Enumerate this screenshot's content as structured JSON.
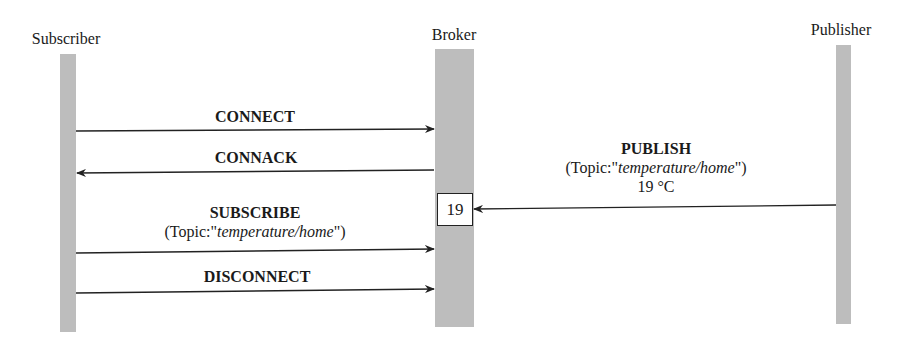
{
  "actors": [
    {
      "id": "subscriber",
      "label": "Subscriber"
    },
    {
      "id": "broker",
      "label": "Broker"
    },
    {
      "id": "publisher",
      "label": "Publisher"
    }
  ],
  "messages": [
    {
      "label": "CONNECT",
      "from": "Subscriber",
      "to": "Broker"
    },
    {
      "label": "CONNACK",
      "from": "Broker",
      "to": "Subscriber"
    },
    {
      "label": "PUBLISH",
      "topic_prefix": "(Topic:\"",
      "topic": "temperature/home",
      "topic_suffix": "\")",
      "payload": "19 °C",
      "from": "Publisher",
      "to": "Broker"
    },
    {
      "label": "SUBSCRIBE",
      "topic_prefix": "(Topic:\"",
      "topic": "temperature/home",
      "topic_suffix": "\")",
      "from": "Subscriber",
      "to": "Broker"
    },
    {
      "label": "DISCONNECT",
      "from": "Subscriber",
      "to": "Broker"
    }
  ],
  "broker_store": {
    "value": "19"
  },
  "colors": {
    "lifeline": "#bdbdbd",
    "line": "#222222"
  }
}
